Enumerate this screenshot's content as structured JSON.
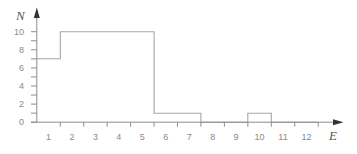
{
  "chart_data": {
    "type": "bar",
    "style": "histogram-step",
    "title": "",
    "xlabel": "E",
    "ylabel": "N",
    "categories": [
      1,
      2,
      3,
      4,
      5,
      6,
      7,
      8,
      9,
      10,
      11,
      12
    ],
    "values": [
      7,
      10,
      10,
      10,
      10,
      1,
      1,
      0,
      0,
      1,
      0,
      0
    ],
    "x_tick_labels": [
      "1",
      "2",
      "3",
      "4",
      "5",
      "6",
      "7",
      "8",
      "9",
      "10",
      "11",
      "12"
    ],
    "y_tick_labels": [
      "0",
      "2",
      "4",
      "6",
      "8",
      "10"
    ],
    "y_tick_values": [
      0,
      2,
      4,
      6,
      8,
      10
    ],
    "y_minor_ticks": [
      0,
      1,
      2,
      3,
      4,
      5,
      6,
      7,
      8,
      9,
      10
    ],
    "x_tick_edges": [
      1.5,
      2.5,
      3.5,
      4.5,
      5.5,
      6.5,
      7.5,
      8.5,
      9.5,
      10.5,
      11.5,
      12.5
    ],
    "xlim": [
      0.5,
      12.8
    ],
    "ylim": [
      0,
      10
    ],
    "grid": false,
    "legend": null
  },
  "colors": {
    "axis": "#8c8c8c",
    "arrow": "#333333",
    "histogram_line": "#a6a6a6",
    "tick_label": "#8a8a8a"
  }
}
